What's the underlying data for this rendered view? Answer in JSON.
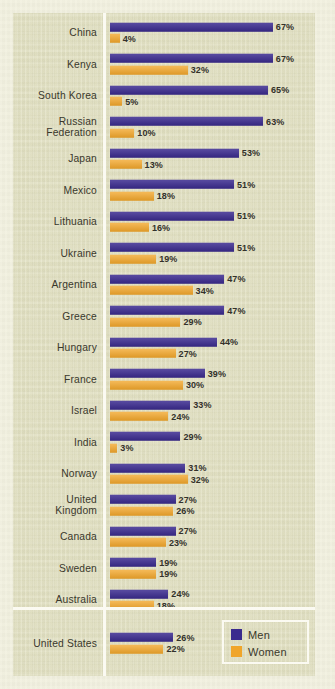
{
  "legend": {
    "men_label": "Men",
    "women_label": "Women",
    "men_color": "#3a2a8e",
    "women_color": "#f0a52a"
  },
  "chart_data": {
    "type": "bar",
    "orientation": "horizontal",
    "title": "",
    "xlabel": "",
    "ylabel": "",
    "xlim": [
      0,
      70
    ],
    "grid": false,
    "legend_position": "bottom-right",
    "value_suffix": "%",
    "categories": [
      "China",
      "Kenya",
      "South Korea",
      "Russian\nFederation",
      "Japan",
      "Mexico",
      "Lithuania",
      "Ukraine",
      "Argentina",
      "Greece",
      "Hungary",
      "France",
      "Israel",
      "India",
      "Norway",
      "United\nKingdom",
      "Canada",
      "Sweden",
      "Australia",
      "United States"
    ],
    "series": [
      {
        "name": "Men",
        "color": "#3a2a8e",
        "values": [
          67,
          67,
          65,
          63,
          53,
          51,
          51,
          51,
          47,
          47,
          44,
          39,
          33,
          29,
          31,
          27,
          27,
          19,
          24,
          26
        ],
        "labels": [
          "67%",
          "67%",
          "65%",
          "63%",
          "53%",
          "51%",
          "51%",
          "51%",
          "47%",
          "47%",
          "44%",
          "39%",
          "33%",
          "29%",
          "31%",
          "27%",
          "27%",
          "19%",
          "24%",
          "26%"
        ]
      },
      {
        "name": "Women",
        "color": "#f0a52a",
        "values": [
          4,
          32,
          5,
          10,
          13,
          18,
          16,
          19,
          34,
          29,
          27,
          30,
          24,
          3,
          32,
          26,
          23,
          19,
          18,
          22
        ],
        "labels": [
          "4%",
          "32%",
          "5%",
          "10%",
          "13%",
          "18%",
          "16%",
          "19%",
          "34%",
          "29%",
          "27%",
          "30%",
          "24%",
          "3%",
          "32%",
          "26%",
          "23%",
          "19%",
          "18%",
          "22%"
        ]
      }
    ]
  }
}
